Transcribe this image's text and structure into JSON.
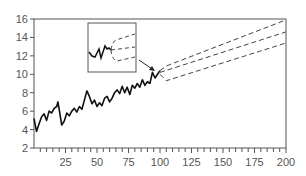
{
  "chart_data": {
    "type": "line",
    "title": "",
    "xlabel": "",
    "ylabel": "",
    "xlim": [
      0,
      200
    ],
    "ylim": [
      2,
      16
    ],
    "grid": false,
    "x_ticks": [
      25,
      50,
      75,
      100,
      125,
      150,
      175,
      200
    ],
    "y_ticks": [
      2,
      4,
      6,
      8,
      10,
      12,
      14,
      16
    ],
    "series": [
      {
        "name": "observed",
        "style": "solid",
        "x": [
          0,
          2,
          4,
          6,
          8,
          10,
          12,
          14,
          16,
          18,
          19,
          20,
          22,
          24,
          26,
          28,
          30,
          32,
          34,
          36,
          38,
          40,
          42,
          44,
          46,
          48,
          50,
          52,
          54,
          56,
          58,
          60,
          62,
          64,
          66,
          68,
          70,
          72,
          74,
          76,
          78,
          80,
          82,
          84,
          86,
          88,
          90,
          92,
          94,
          96,
          98,
          100
        ],
        "values": [
          5.2,
          3.8,
          4.6,
          5.4,
          5.7,
          5.0,
          6.0,
          5.8,
          6.3,
          6.5,
          7.0,
          6.2,
          4.5,
          4.9,
          5.8,
          5.5,
          6.0,
          6.3,
          5.9,
          6.5,
          6.2,
          7.2,
          8.2,
          7.6,
          6.8,
          7.2,
          6.5,
          6.9,
          6.6,
          7.4,
          7.6,
          7.0,
          7.4,
          8.0,
          8.3,
          7.9,
          8.7,
          8.0,
          8.6,
          7.8,
          8.8,
          8.5,
          9.0,
          8.6,
          9.4,
          8.8,
          9.2,
          9.0,
          10.2,
          9.6,
          10.0,
          10.4
        ]
      },
      {
        "name": "forecast-upper",
        "style": "dashed",
        "x": [
          100,
          105,
          200
        ],
        "values": [
          10.4,
          10.9,
          15.9
        ]
      },
      {
        "name": "forecast-mean",
        "style": "dashed",
        "x": [
          100,
          200
        ],
        "values": [
          10.2,
          14.6
        ]
      },
      {
        "name": "forecast-lower",
        "style": "dashed",
        "x": [
          100,
          105,
          200
        ],
        "values": [
          10.0,
          9.3,
          13.4
        ]
      }
    ],
    "annotations": [
      {
        "type": "inset",
        "description": "zoomed view of series end with forecast fan"
      },
      {
        "type": "arrow",
        "from": "inset",
        "to": "forecast start near x=100"
      }
    ]
  }
}
